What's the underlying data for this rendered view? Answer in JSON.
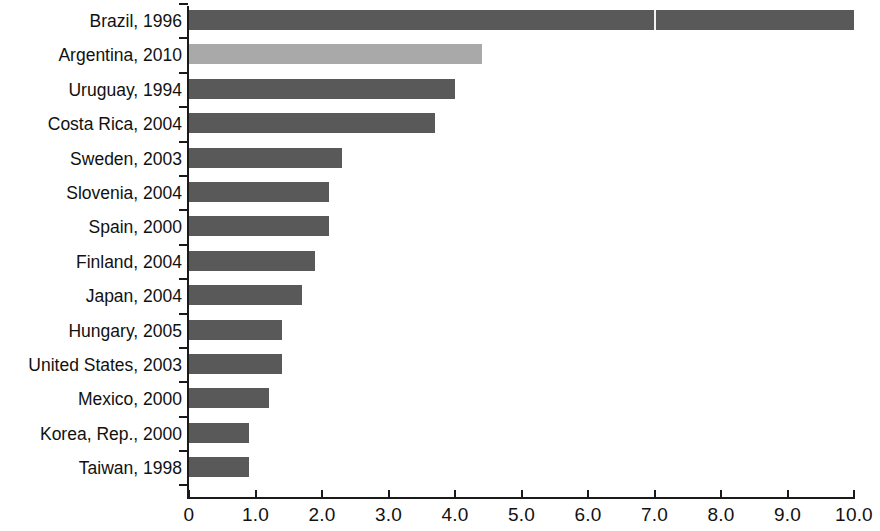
{
  "chart_data": {
    "type": "bar",
    "orientation": "horizontal",
    "title": "",
    "subtitle": "",
    "xlabel": "",
    "ylabel": "",
    "xlim": [
      0,
      10
    ],
    "grid": false,
    "legend": null,
    "categories": [
      "Brazil, 1996",
      "Argentina, 2010",
      "Uruguay, 1994",
      "Costa Rica, 2004",
      "Sweden, 2003",
      "Slovenia, 2004",
      "Spain, 2000",
      "Finland, 2004",
      "Japan, 2004",
      "Hungary, 2005",
      "United States, 2003",
      "Mexico, 2000",
      "Korea, Rep., 2000",
      "Taiwan, 1998"
    ],
    "values": [
      10.0,
      4.4,
      4.0,
      3.7,
      2.3,
      2.1,
      2.1,
      1.9,
      1.7,
      1.4,
      1.4,
      1.2,
      0.9,
      0.9
    ],
    "highlight_index": 1,
    "colors": {
      "bar": "#595959",
      "bar_highlight": "#a9a9a9",
      "axis": "#1a1a1a",
      "text": "#111111",
      "background": "#ffffff"
    },
    "xticks": [
      {
        "value": 0,
        "label": "0"
      },
      {
        "value": 1,
        "label": "1.0"
      },
      {
        "value": 2,
        "label": "2.0"
      },
      {
        "value": 3,
        "label": "3.0"
      },
      {
        "value": 4,
        "label": "4.0"
      },
      {
        "value": 5,
        "label": "5.0"
      },
      {
        "value": 6,
        "label": "6.0"
      },
      {
        "value": 7,
        "label": "7.0"
      },
      {
        "value": 8,
        "label": "8.0"
      },
      {
        "value": 9,
        "label": "9.0"
      },
      {
        "value": 10,
        "label": "10.0"
      }
    ]
  }
}
